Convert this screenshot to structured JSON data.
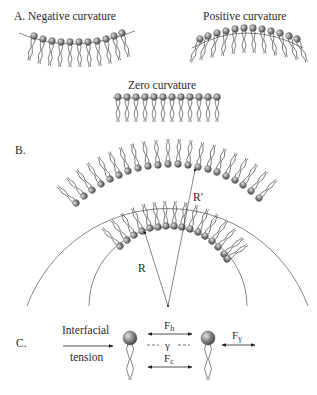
{
  "figure": {
    "panel_a": {
      "letter": "A.",
      "negative_label": "Negative curvature",
      "positive_label": "Positive curvature",
      "zero_label": "Zero curvature"
    },
    "panel_b": {
      "letter": "B.",
      "radius_small": "R",
      "radius_large": "R′"
    },
    "panel_c": {
      "letter": "C.",
      "interfacial": "Interfacial",
      "tension": "tension",
      "force_head": "F",
      "force_head_sub": "h",
      "force_chain": "F",
      "force_chain_sub": "c",
      "force_gamma": "F",
      "force_gamma_sub": "γ",
      "gamma": "γ"
    }
  },
  "colors": {
    "head": "#8a8a8a",
    "head_highlight": "#d8d8d8",
    "line": "#333333",
    "text": "#2a2a2a"
  }
}
